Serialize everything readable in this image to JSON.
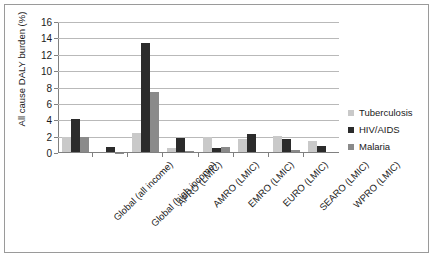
{
  "chart_data": {
    "type": "bar",
    "title": "",
    "xlabel": "",
    "ylabel": "All cause DALY burden (%)",
    "ylim": [
      0,
      16
    ],
    "yticks": [
      "0",
      "2",
      "4",
      "6",
      "8",
      "10",
      "12",
      "14",
      "16"
    ],
    "grid": true,
    "legend_position": "right",
    "categories": [
      "Global (all income)",
      "Global (high income)",
      "AFRO (LMIC)",
      "AMRO (LMIC)",
      "EMRO (LMIC)",
      "EURO (LMIC)",
      "SEARO (LMIC)",
      "WPRO (LMIC)"
    ],
    "series": [
      {
        "name": "Tuberculosis",
        "color": "#c9c9c9",
        "values": [
          2.0,
          0.1,
          2.4,
          0.6,
          1.9,
          1.7,
          2.1,
          1.5
        ]
      },
      {
        "name": "HIV/AIDS",
        "color": "#2b2b2b",
        "values": [
          4.2,
          0.7,
          13.4,
          1.8,
          0.6,
          2.3,
          1.7,
          0.9
        ]
      },
      {
        "name": "Malaria",
        "color": "#8a8a8a",
        "values": [
          2.0,
          0.05,
          7.5,
          0.2,
          0.75,
          0.15,
          0.4,
          0.15
        ]
      }
    ]
  }
}
